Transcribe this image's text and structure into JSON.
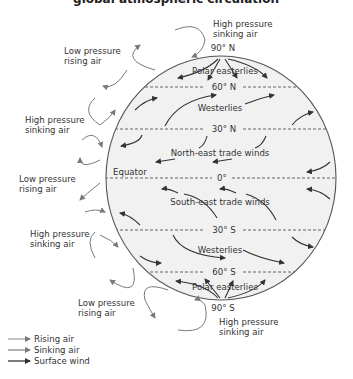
{
  "title": "global atmospheric circulation",
  "latitudes": {
    "n90": "90° N",
    "n60": "60° N",
    "n30": "30° N",
    "eq": "0°",
    "s30": "30° S",
    "s60": "60° S",
    "s90": "90° S",
    "equator_label": "Equator"
  },
  "winds": {
    "polar_n": "Polar easterlies",
    "west_n": "Westerlies",
    "trade_n": "North-east trade winds",
    "trade_s": "South-east trade winds",
    "west_s": "Westerlies",
    "polar_s": "Polar easterlies"
  },
  "pressure_labels": {
    "top": [
      "High pressure",
      "sinking air"
    ],
    "left_1": [
      "Low pressure",
      "rising air"
    ],
    "left_2": [
      "High pressure",
      "sinking air"
    ],
    "left_3": [
      "Low pressure",
      "rising air"
    ],
    "left_4": [
      "High pressure",
      "sinking air"
    ],
    "left_5": [
      "Low pressure",
      "rising air"
    ],
    "bottom": [
      "High pressure",
      "sinking air"
    ]
  },
  "legend": [
    {
      "label": "Rising air",
      "color": "#888888"
    },
    {
      "label": "Sinking air",
      "color": "#666666"
    },
    {
      "label": "Surface wind",
      "color": "#222222"
    }
  ],
  "colors": {
    "globe_fill": "#f1f1f1",
    "globe_stroke": "#555555",
    "text": "#333333"
  }
}
